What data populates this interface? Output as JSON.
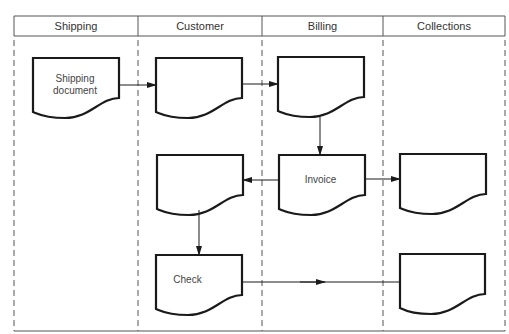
{
  "diagram": {
    "type": "swimlane-flowchart",
    "lanes": [
      {
        "label": "Shipping"
      },
      {
        "label": "Customer"
      },
      {
        "label": "Billing"
      },
      {
        "label": "Collections"
      }
    ],
    "documents": [
      {
        "id": "shipping-doc",
        "lane": "Shipping",
        "label_line1": "Shipping",
        "label_line2": "document"
      },
      {
        "id": "customer-doc-1",
        "lane": "Customer",
        "label": ""
      },
      {
        "id": "billing-doc-1",
        "lane": "Billing",
        "label": ""
      },
      {
        "id": "invoice",
        "lane": "Billing",
        "label": "Invoice"
      },
      {
        "id": "customer-doc-2",
        "lane": "Customer",
        "label": ""
      },
      {
        "id": "collections-doc-1",
        "lane": "Collections",
        "label": ""
      },
      {
        "id": "check",
        "lane": "Customer",
        "label": "Check"
      },
      {
        "id": "collections-doc-2",
        "lane": "Collections",
        "label": ""
      }
    ],
    "edges": [
      {
        "from": "shipping-doc",
        "to": "customer-doc-1"
      },
      {
        "from": "customer-doc-1",
        "to": "billing-doc-1"
      },
      {
        "from": "billing-doc-1",
        "to": "invoice"
      },
      {
        "from": "invoice",
        "to": "customer-doc-2"
      },
      {
        "from": "invoice",
        "to": "collections-doc-1"
      },
      {
        "from": "customer-doc-2",
        "to": "check"
      },
      {
        "from": "check",
        "to": "collections-doc-2"
      }
    ],
    "colors": {
      "stroke": "#1a1a1a",
      "frame": "#555555"
    }
  }
}
